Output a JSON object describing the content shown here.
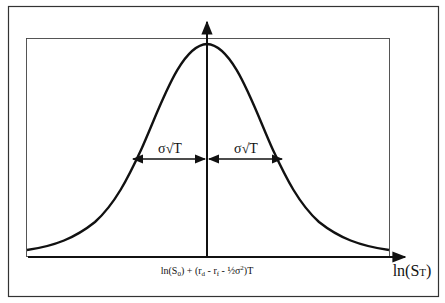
{
  "diagram": {
    "title": "",
    "type": "normal-distribution-of-log-price",
    "labels": {
      "spread_left": "σ√T",
      "spread_right": "σ√T",
      "mean_prefix": "ln(S",
      "mean_sub0": "0",
      "mean_mid1": ") + (r",
      "mean_sub_d": "d",
      "mean_mid2": " - r",
      "mean_sub_f": "f",
      "mean_mid3": " - ½σ",
      "mean_sup2": "2",
      "mean_suffix": ")T",
      "x_axis_prefix": "ln(S",
      "x_axis_sub": "T",
      "x_axis_suffix": ")"
    },
    "colors": {
      "stroke": "#111111",
      "frame": "#333333",
      "background": "#ffffff"
    }
  }
}
